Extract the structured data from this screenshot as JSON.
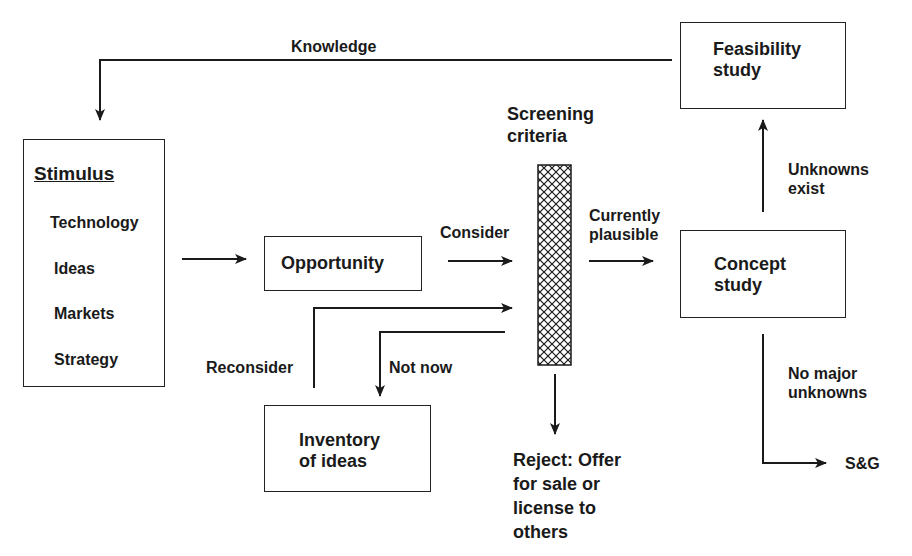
{
  "diagram": {
    "title": "",
    "nodes": {
      "stimulus": {
        "title": "Stimulus",
        "items": [
          "Technology",
          "Ideas",
          "Markets",
          "Strategy"
        ]
      },
      "opportunity": {
        "label": "Opportunity"
      },
      "screening": {
        "label": "Screening\ncriteria"
      },
      "concept": {
        "label": "Concept\nstudy"
      },
      "feasibility": {
        "label": "Feasibility\nstudy"
      },
      "inventory": {
        "label": "Inventory\nof ideas"
      },
      "reject": {
        "label": "Reject: Offer\nfor sale or\nlicense to\nothers"
      },
      "sg": {
        "label": "S&G"
      }
    },
    "edges": {
      "knowledge": "Knowledge",
      "consider": "Consider",
      "currently_plausible": "Currently\nplausible",
      "unknowns_exist": "Unknowns\nexist",
      "no_major_unknowns": "No major\nunknowns",
      "reconsider": "Reconsider",
      "not_now": "Not now"
    },
    "colors": {
      "line": "#1a1a1a",
      "background": "#ffffff",
      "hatch": "#1a1a1a"
    }
  }
}
